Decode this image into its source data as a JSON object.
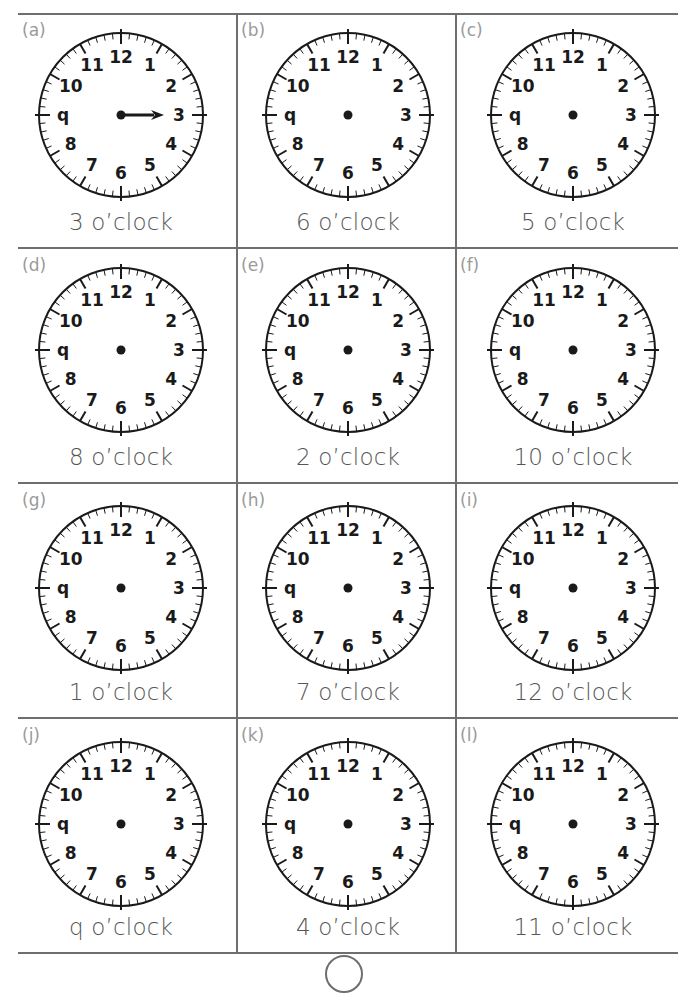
{
  "worksheet": {
    "colors": {
      "grid_line": "#6e6e6e",
      "letter": "#9a9a9a",
      "label": "#555555",
      "clock_ink": "#1a1a1a"
    },
    "clock_numerals": [
      "12",
      "1",
      "2",
      "3",
      "4",
      "5",
      "6",
      "7",
      "8",
      "q",
      "10",
      "11"
    ],
    "cells": [
      {
        "letter": "(a)",
        "label": "3 o’clock",
        "hour_hand_drawn": true,
        "hand_hour": 3
      },
      {
        "letter": "(b)",
        "label": "6 o’clock",
        "hour_hand_drawn": false
      },
      {
        "letter": "(c)",
        "label": "5 o’clock",
        "hour_hand_drawn": false
      },
      {
        "letter": "(d)",
        "label": "8 o’clock",
        "hour_hand_drawn": false
      },
      {
        "letter": "(e)",
        "label": "2 o’clock",
        "hour_hand_drawn": false
      },
      {
        "letter": "(f)",
        "label": "10 o’clock",
        "hour_hand_drawn": false
      },
      {
        "letter": "(g)",
        "label": "1 o’clock",
        "hour_hand_drawn": false
      },
      {
        "letter": "(h)",
        "label": "7 o’clock",
        "hour_hand_drawn": false
      },
      {
        "letter": "(i)",
        "label": "12 o’clock",
        "hour_hand_drawn": false
      },
      {
        "letter": "(j)",
        "label": "q o’clock",
        "hour_hand_drawn": false
      },
      {
        "letter": "(k)",
        "label": "4 o’clock",
        "hour_hand_drawn": false
      },
      {
        "letter": "(l)",
        "label": "11 o’clock",
        "hour_hand_drawn": false
      }
    ]
  }
}
